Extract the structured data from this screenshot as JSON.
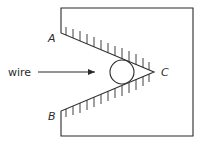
{
  "diagram": {
    "type": "v-groove-with-wire",
    "labels": {
      "wire": "wire",
      "point_a": "A",
      "point_b": "B",
      "point_c": "C"
    },
    "colors": {
      "stroke": "#2b2b2b",
      "background": "#ffffff"
    },
    "box": {
      "left": 61,
      "top": 8,
      "right": 193,
      "bottom": 136
    },
    "points": {
      "A": {
        "x": 61,
        "y": 33
      },
      "B": {
        "x": 61,
        "y": 111
      },
      "C": {
        "x": 154,
        "y": 72
      }
    },
    "wire_circle": {
      "cx": 122,
      "cy": 72,
      "r": 12
    },
    "arrow": {
      "x1": 38,
      "y1": 72,
      "x2": 95,
      "y2": 72
    }
  }
}
